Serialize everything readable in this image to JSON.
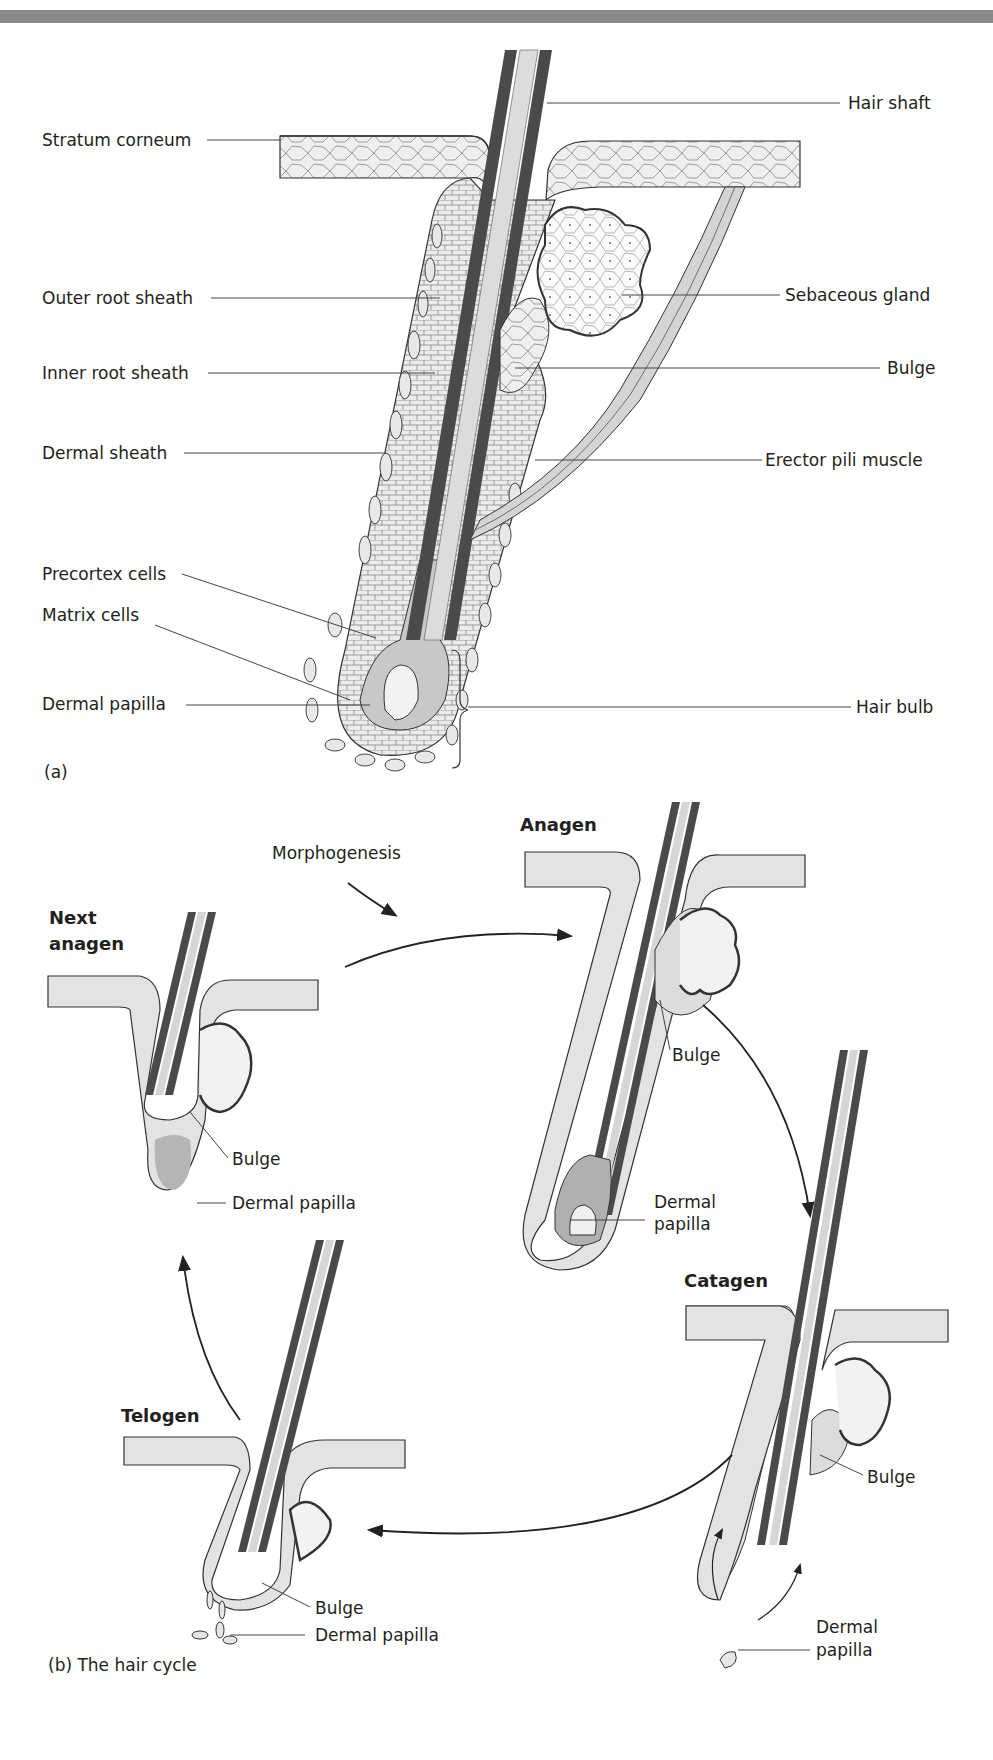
{
  "figure": {
    "panel_a": {
      "tag": "(a)",
      "labels_left": [
        "Stratum corneum",
        "Outer root sheath",
        "Inner root sheath",
        "Dermal sheath",
        "Precortex cells",
        "Matrix cells",
        "Dermal papilla"
      ],
      "labels_right": [
        "Hair shaft",
        "Sebaceous gland",
        "Bulge",
        "Erector pili muscle",
        "Hair bulb"
      ]
    },
    "panel_b": {
      "tag": "(b)  The hair cycle",
      "morphogenesis": "Morphogenesis",
      "stages": {
        "anagen": {
          "title": "Anagen",
          "bulge": "Bulge",
          "papilla_line1": "Dermal",
          "papilla_line2": "papilla"
        },
        "catagen": {
          "title": "Catagen",
          "bulge": "Bulge",
          "papilla_line1": "Dermal",
          "papilla_line2": "papilla"
        },
        "telogen": {
          "title": "Telogen",
          "bulge": "Bulge",
          "papilla": "Dermal papilla"
        },
        "next_anagen": {
          "title_line1": "Next",
          "title_line2": "anagen",
          "bulge": "Bulge",
          "papilla": "Dermal papilla"
        }
      }
    },
    "colors": {
      "header_bar": "#8a8a8a",
      "shaft_dark": "#4a4a4a",
      "tissue_light": "#e6e6e6",
      "tissue_mid": "#b8b8b8",
      "line": "#333333"
    }
  }
}
